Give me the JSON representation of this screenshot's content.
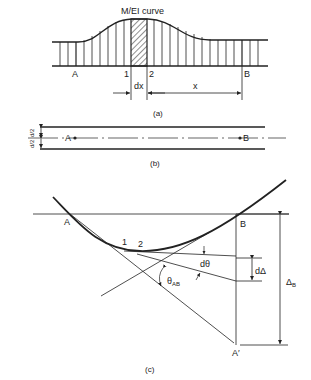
{
  "figure_a": {
    "curve_label": "M/EI curve",
    "point_a": "A",
    "point_1": "1",
    "point_2": "2",
    "point_b": "B",
    "dim_dx": "dx",
    "dim_x": "x",
    "caption": "(a)"
  },
  "figure_b": {
    "dim_top": "d/2",
    "dim_bottom": "d/2",
    "point_a": "A",
    "point_b": "B",
    "caption": "(b)"
  },
  "figure_c": {
    "point_a": "A",
    "point_b": "B",
    "point_1": "1",
    "point_2": "2",
    "d_theta": "dθ",
    "theta_ab": "θ",
    "theta_ab_sub": "AB",
    "d_delta": "dΔ",
    "delta_b": "Δ",
    "delta_b_sub": "B",
    "point_a_prime": "A′",
    "caption": "(c)"
  }
}
